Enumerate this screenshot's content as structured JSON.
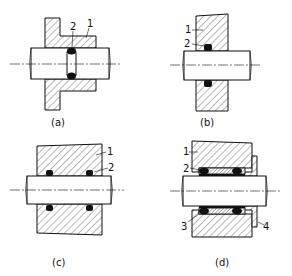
{
  "figure": {
    "panels": [
      {
        "id": "a",
        "caption": "(a)",
        "labels": [
          "1",
          "2"
        ]
      },
      {
        "id": "b",
        "caption": "(b)",
        "labels": [
          "1",
          "2"
        ]
      },
      {
        "id": "c",
        "caption": "(c)",
        "labels": [
          "1",
          "2"
        ]
      },
      {
        "id": "d",
        "caption": "(d)",
        "labels": [
          "1",
          "2",
          "3",
          "4"
        ]
      }
    ]
  },
  "colors": {
    "ink": "#111111",
    "background": "#ffffff"
  }
}
